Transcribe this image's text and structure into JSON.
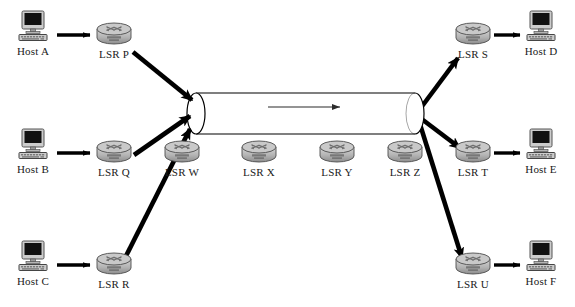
{
  "diagram": {
    "type": "network-topology",
    "background_color": "#ffffff",
    "line_color": "#000000",
    "router_body_color": "#b3b3b3",
    "router_dark_color": "#6e6e6e",
    "host_screen_color": "#111111",
    "host_case_color": "#cccccc",
    "tunnel_fill": "#ffffff",
    "tunnel_stroke": "#000000",
    "label_color": "#1a1a1a"
  },
  "hosts": [
    {
      "id": "host-a",
      "label": "Host A",
      "icon": "computer-icon",
      "x": 33,
      "y": 33
    },
    {
      "id": "host-b",
      "label": "Host B",
      "icon": "computer-icon",
      "x": 33,
      "y": 151
    },
    {
      "id": "host-c",
      "label": "Host C",
      "icon": "computer-icon",
      "x": 33,
      "y": 263
    },
    {
      "id": "host-d",
      "label": "Host D",
      "icon": "computer-icon",
      "x": 541,
      "y": 33
    },
    {
      "id": "host-e",
      "label": "Host E",
      "icon": "computer-icon",
      "x": 541,
      "y": 151
    },
    {
      "id": "host-f",
      "label": "Host F",
      "icon": "computer-icon",
      "x": 541,
      "y": 263
    }
  ],
  "routers": [
    {
      "id": "lsr-p",
      "label": "LSR P",
      "icon": "router-icon",
      "x": 114,
      "y": 41
    },
    {
      "id": "lsr-q",
      "label": "LSR Q",
      "icon": "router-icon",
      "x": 114,
      "y": 159
    },
    {
      "id": "lsr-r",
      "label": "LSR R",
      "icon": "router-icon",
      "x": 114,
      "y": 271
    },
    {
      "id": "lsr-w",
      "label": "LSR W",
      "icon": "router-icon",
      "x": 182,
      "y": 159
    },
    {
      "id": "lsr-x",
      "label": "LSR X",
      "icon": "router-icon",
      "x": 259,
      "y": 159
    },
    {
      "id": "lsr-y",
      "label": "LSR Y",
      "icon": "router-icon",
      "x": 337,
      "y": 159
    },
    {
      "id": "lsr-z",
      "label": "LSR Z",
      "icon": "router-icon",
      "x": 405,
      "y": 159
    },
    {
      "id": "lsr-s",
      "label": "LSR S",
      "icon": "router-icon",
      "x": 473,
      "y": 41
    },
    {
      "id": "lsr-t",
      "label": "LSR T",
      "icon": "router-icon",
      "x": 473,
      "y": 159
    },
    {
      "id": "lsr-u",
      "label": "LSR U",
      "icon": "router-icon",
      "x": 473,
      "y": 271
    }
  ],
  "tunnel": {
    "id": "lsp-tunnel",
    "name": "lsp-tunnel-cylinder",
    "left_x": 196,
    "right_x": 415,
    "top_y": 93,
    "bottom_y": 134,
    "cap_rx": 9,
    "flow_arrow": {
      "name": "tunnel-flow-arrow",
      "from_x": 268,
      "to_x": 340,
      "y": 107,
      "direction": "left-to-right"
    }
  },
  "edges": [
    {
      "id": "e-host-a-lsr-p",
      "name": "arrow-host-a-to-lsr-p",
      "kind": "short-arrow",
      "x1": 57,
      "y1": 35,
      "x2": 90,
      "y2": 35
    },
    {
      "id": "e-host-b-lsr-q",
      "name": "arrow-host-b-to-lsr-q",
      "kind": "short-arrow",
      "x1": 57,
      "y1": 153,
      "x2": 90,
      "y2": 153
    },
    {
      "id": "e-host-c-lsr-r",
      "name": "arrow-host-c-to-lsr-r",
      "kind": "short-arrow",
      "x1": 57,
      "y1": 265,
      "x2": 90,
      "y2": 265
    },
    {
      "id": "e-lsr-s-host-d",
      "name": "arrow-lsr-s-to-host-d",
      "kind": "short-arrow",
      "x1": 494,
      "y1": 35,
      "x2": 520,
      "y2": 35
    },
    {
      "id": "e-lsr-t-host-e",
      "name": "arrow-lsr-t-to-host-e",
      "kind": "short-arrow",
      "x1": 494,
      "y1": 153,
      "x2": 520,
      "y2": 153
    },
    {
      "id": "e-lsr-u-host-f",
      "name": "arrow-lsr-u-to-host-f",
      "kind": "short-arrow",
      "x1": 494,
      "y1": 265,
      "x2": 520,
      "y2": 265
    },
    {
      "id": "e-lsr-p-tunnel",
      "name": "arrow-lsr-p-to-tunnel-ingress",
      "kind": "thick-arrow",
      "x1": 133,
      "y1": 52,
      "x2": 192,
      "y2": 100
    },
    {
      "id": "e-lsr-q-tunnel",
      "name": "arrow-lsr-q-to-tunnel-ingress",
      "kind": "thick-arrow",
      "x1": 134,
      "y1": 155,
      "x2": 190,
      "y2": 116
    },
    {
      "id": "e-lsr-r-tunnel",
      "name": "arrow-lsr-r-to-tunnel-ingress",
      "kind": "thick-arrow",
      "x1": 125,
      "y1": 258,
      "x2": 190,
      "y2": 129
    },
    {
      "id": "e-tunnel-lsr-s",
      "name": "arrow-tunnel-egress-to-lsr-s",
      "kind": "thick-arrow",
      "x1": 417,
      "y1": 113,
      "x2": 458,
      "y2": 58
    },
    {
      "id": "e-tunnel-lsr-t",
      "name": "arrow-tunnel-egress-to-lsr-t",
      "kind": "thick-arrow",
      "x1": 419,
      "y1": 117,
      "x2": 460,
      "y2": 148
    },
    {
      "id": "e-tunnel-lsr-u",
      "name": "arrow-tunnel-egress-to-lsr-u",
      "kind": "thick-arrow",
      "x1": 418,
      "y1": 118,
      "x2": 462,
      "y2": 258
    }
  ]
}
